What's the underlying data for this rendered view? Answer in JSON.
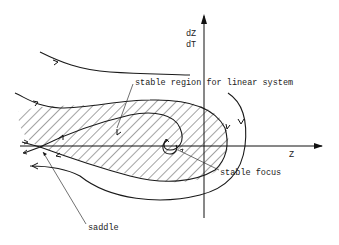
{
  "diagram": {
    "type": "phase-portrait",
    "axes": {
      "x_label": "Z",
      "y_label_top": "dZ",
      "y_label_bottom": "dT"
    },
    "annotations": {
      "stable_region": "stable region for linear system",
      "stable_focus": "stable focus",
      "saddle": "saddle"
    },
    "colors": {
      "ink": "#1a1a1a",
      "background": "#ffffff"
    }
  }
}
